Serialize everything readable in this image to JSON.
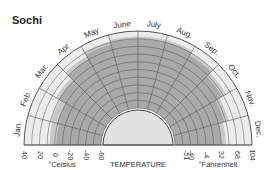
{
  "chart_data": {
    "type": "polar-range",
    "title": "Sochi",
    "center_label": "TEMPERATURE",
    "celsius_label": "°Celsius",
    "fahrenheit_label": "°Fahrenheit",
    "months": [
      "Jan.",
      "Feb.",
      "Mar.",
      "Apr.",
      "May",
      "June",
      "July",
      "Aug.",
      "Sep.",
      "Oct.",
      "Nov.",
      "Dec."
    ],
    "radial_range_celsius": [
      -60,
      40
    ],
    "celsius_ticks": [
      "40",
      "20",
      "0",
      "-20",
      "-40",
      "-60"
    ],
    "celsius_tick_values": [
      40,
      20,
      0,
      -20,
      -40,
      -60
    ],
    "fahrenheit_ticks": [
      "-51",
      "-40",
      "-4",
      "32",
      "68",
      "104"
    ],
    "fahrenheit_tick_values_celsius": [
      -46,
      -40,
      -20,
      0,
      20,
      40
    ],
    "series": [
      {
        "name": "average high (dark band upper edge)",
        "values": [
          -2,
          0,
          10,
          20,
          27,
          30,
          30,
          30,
          26,
          18,
          8,
          0
        ]
      },
      {
        "name": "record high (medium band upper edge)",
        "values": [
          7,
          9,
          15,
          25,
          31,
          33,
          33,
          33,
          30,
          24,
          14,
          6
        ]
      }
    ],
    "grid": true,
    "colors": {
      "light": "#ececec",
      "medium": "#c8c8c8",
      "dark": "#a9a9a9",
      "center": "#e2e2e2",
      "grid": "#555555"
    }
  }
}
